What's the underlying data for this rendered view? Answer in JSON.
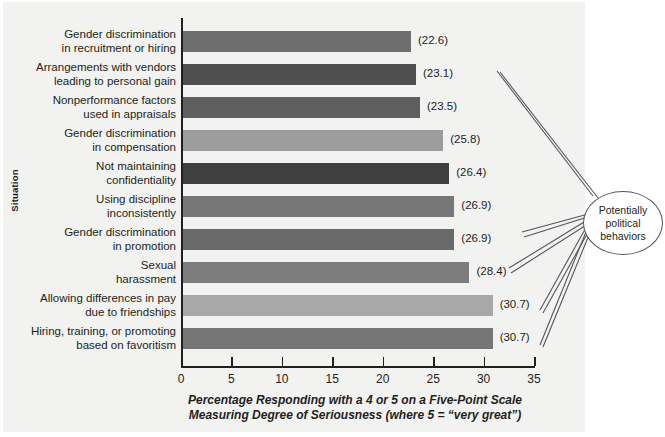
{
  "chart_data": {
    "type": "bar",
    "orientation": "horizontal",
    "title": "",
    "xlabel_line1": "Percentage Responding with a 4 or 5 on a Five-Point Scale",
    "xlabel_line2": "Measuring Degree of Seriousness (where 5 = “very great”)",
    "ylabel": "Situation",
    "xlim": [
      0,
      35
    ],
    "xticks": [
      0,
      5,
      10,
      15,
      20,
      25,
      30,
      35
    ],
    "grid": false,
    "legend": null,
    "categories": [
      "Gender discrimination in recruitment or hiring",
      "Arrangements with vendors leading to personal gain",
      "Nonperformance factors used in appraisals",
      "Gender discrimination in compensation",
      "Not maintaining confidentiality",
      "Using discipline inconsistently",
      "Gender discrimination in promotion",
      "Sexual harassment",
      "Allowing differences in pay due to friendships",
      "Hiring, training, or promoting based on favoritism"
    ],
    "values": [
      22.6,
      23.1,
      23.5,
      25.8,
      26.4,
      26.9,
      26.9,
      28.4,
      30.7,
      30.7
    ],
    "value_labels": [
      "(22.6)",
      "(23.1)",
      "(23.5)",
      "(25.8)",
      "(26.4)",
      "(26.9)",
      "(26.9)",
      "(28.4)",
      "(30.7)",
      "(30.7)"
    ],
    "bar_colors": [
      "#6e6e6e",
      "#4f4f4f",
      "#5f5f5f",
      "#9c9c9c",
      "#3f3f3f",
      "#777777",
      "#6a6a6a",
      "#7d7d7d",
      "#a8a8a8",
      "#767676"
    ],
    "annotations": [
      {
        "text_line1": "Potentially",
        "text_line2": "political",
        "text_line3": "behaviors",
        "points_to": [
          "(23.1)",
          "(26.9)",
          "(30.7)",
          "(30.7)"
        ]
      }
    ]
  },
  "categories_display": [
    {
      "l1": "Gender discrimination",
      "l2": "in recruitment or hiring"
    },
    {
      "l1": "Arrangements with vendors",
      "l2": "leading to personal gain"
    },
    {
      "l1": "Nonperformance factors",
      "l2": "used in appraisals"
    },
    {
      "l1": "Gender discrimination",
      "l2": "in compensation"
    },
    {
      "l1": "Not maintaining",
      "l2": "confidentiality"
    },
    {
      "l1": "Using discipline",
      "l2": "inconsistently"
    },
    {
      "l1": "Gender discrimination",
      "l2": "in promotion"
    },
    {
      "l1": "Sexual",
      "l2": "harassment"
    },
    {
      "l1": "Allowing differences in pay",
      "l2": "due to friendships"
    },
    {
      "l1": "Hiring, training, or promoting",
      "l2": "based on favoritism"
    }
  ],
  "axis": {
    "ylabel": "Situation",
    "ticks": [
      "0",
      "5",
      "10",
      "15",
      "20",
      "25",
      "30",
      "35"
    ],
    "xtitle_line1": "Percentage Responding with a 4 or 5 on a Five-Point Scale",
    "xtitle_line2": "Measuring Degree of Seriousness (where 5 = “very great”)"
  },
  "callout": {
    "line1": "Potentially",
    "line2": "political",
    "line3": "behaviors"
  }
}
